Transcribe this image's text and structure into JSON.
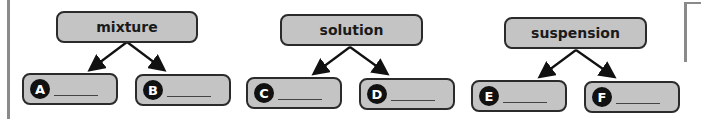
{
  "groups": [
    {
      "parent": "mixture",
      "children": [
        {
          "letter": "A",
          "answer": ""
        },
        {
          "letter": "B",
          "answer": ""
        }
      ]
    },
    {
      "parent": "solution",
      "children": [
        {
          "letter": "C",
          "answer": ""
        },
        {
          "letter": "D",
          "answer": ""
        }
      ]
    },
    {
      "parent": "suspension",
      "children": [
        {
          "letter": "E",
          "answer": ""
        },
        {
          "letter": "F",
          "answer": ""
        }
      ]
    }
  ],
  "colors": {
    "box_fill": "#c4c4c4",
    "border": "#2b2b2b",
    "badge": "#111111"
  }
}
